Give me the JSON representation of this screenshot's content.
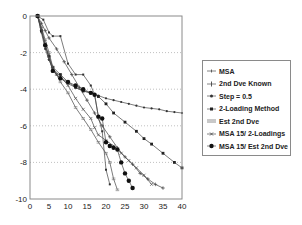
{
  "chart_data": {
    "type": "line",
    "title": "",
    "xlabel": "",
    "ylabel": "",
    "xlim": [
      0,
      40
    ],
    "ylim": [
      -10,
      0
    ],
    "x_ticks": [
      0,
      5,
      10,
      15,
      20,
      25,
      30,
      35,
      40
    ],
    "y_ticks": [
      0,
      -2,
      -4,
      -6,
      -8,
      -10
    ],
    "grid": {
      "horizontal_dotted": true,
      "vertical": false
    },
    "legend_position": "right",
    "series": [
      {
        "name": "MSA",
        "marker": "plus-small",
        "x": [
          2,
          3.5,
          5,
          6,
          8,
          10,
          12,
          14,
          16,
          17,
          18,
          19,
          20,
          21
        ],
        "y": [
          0,
          -0.2,
          -0.9,
          -1.1,
          -1.1,
          -2.6,
          -3.2,
          -3.2,
          -3.8,
          -4.3,
          -5.5,
          -6.3,
          -8.4,
          -9.2
        ]
      },
      {
        "name": "2nd Dve Known",
        "marker": "plus",
        "x": [
          2,
          3,
          4,
          5,
          7,
          9,
          11,
          13,
          15,
          17,
          19,
          21,
          23,
          25,
          27,
          29,
          31,
          33,
          35
        ],
        "y": [
          0,
          -0.4,
          -0.8,
          -1.2,
          -1.8,
          -2.5,
          -3.2,
          -3.9,
          -4.6,
          -5.3,
          -6.0,
          -6.6,
          -7.2,
          -7.7,
          -8.1,
          -8.6,
          -8.9,
          -9.2,
          -9.4
        ]
      },
      {
        "name": "Step = 0.5",
        "marker": "dot-small",
        "x": [
          2,
          3,
          4,
          5,
          6,
          7,
          8,
          10,
          12,
          14,
          16,
          18,
          20,
          22,
          24,
          26,
          28,
          30,
          32,
          34,
          36,
          38,
          40
        ],
        "y": [
          0,
          -0.9,
          -1.8,
          -2.4,
          -2.9,
          -3.2,
          -3.4,
          -3.7,
          -3.9,
          -4.1,
          -4.2,
          -4.35,
          -4.5,
          -4.6,
          -4.7,
          -4.8,
          -4.9,
          -5.0,
          -5.05,
          -5.1,
          -5.2,
          -5.25,
          -5.3
        ]
      },
      {
        "name": "2-Loading Method",
        "marker": "square",
        "x": [
          2,
          3,
          4,
          5,
          6,
          8,
          10,
          12,
          14,
          16,
          18,
          20,
          22,
          25,
          28,
          30,
          32,
          35,
          38,
          40
        ],
        "y": [
          0,
          -0.8,
          -1.6,
          -2.2,
          -2.8,
          -3.2,
          -3.6,
          -3.9,
          -4.1,
          -4.2,
          -4.4,
          -4.8,
          -5.3,
          -5.8,
          -6.3,
          -6.7,
          -7.0,
          -7.5,
          -8.0,
          -8.3
        ]
      },
      {
        "name": "Est 2nd Dve",
        "marker": "dash",
        "x": [
          2,
          3,
          4,
          5,
          6,
          7,
          8,
          10,
          12,
          14,
          16,
          18,
          20,
          21,
          22,
          23
        ],
        "y": [
          0,
          -0.6,
          -1.3,
          -2.0,
          -2.8,
          -3.2,
          -3.6,
          -4.2,
          -5.0,
          -5.6,
          -6.2,
          -6.9,
          -7.5,
          -8.0,
          -8.9,
          -9.5
        ]
      },
      {
        "name": "MSA 15/ 2-Loadings",
        "marker": "asterisk",
        "x": [
          2,
          3,
          4,
          5,
          6,
          8,
          10,
          12,
          14,
          16,
          17,
          18,
          20,
          22,
          24,
          26,
          28,
          30,
          32
        ],
        "y": [
          0,
          -0.7,
          -1.5,
          -2.3,
          -2.9,
          -3.3,
          -3.8,
          -4.5,
          -5.1,
          -5.6,
          -6.1,
          -6.5,
          -6.8,
          -7.1,
          -7.5,
          -7.9,
          -8.3,
          -8.7,
          -9.2
        ]
      },
      {
        "name": "MSA 15/ Est 2nd Dve",
        "marker": "dot-large",
        "x": [
          2,
          4,
          6,
          8,
          10,
          12,
          14,
          16,
          17,
          18,
          19,
          20,
          21,
          22,
          23,
          24,
          25,
          26,
          27
        ],
        "y": [
          0,
          -1.6,
          -3.0,
          -3.4,
          -3.6,
          -3.8,
          -4.0,
          -4.2,
          -4.3,
          -5.5,
          -5.6,
          -6.9,
          -7.1,
          -7.2,
          -7.3,
          -8.0,
          -8.6,
          -9.0,
          -9.4
        ]
      }
    ]
  },
  "legend": {
    "items": [
      {
        "label": "MSA"
      },
      {
        "label": "2nd Dve Known"
      },
      {
        "label": "Step = 0.5"
      },
      {
        "label": "2-Loading Method"
      },
      {
        "label": "Est 2nd Dve"
      },
      {
        "label": "MSA 15/ 2-Loadings"
      },
      {
        "label": "MSA 15/ Est 2nd Dve"
      }
    ]
  },
  "colors": {
    "axis": "#8a8a8a",
    "grid": "#b0b0b0",
    "line": "#444444",
    "marker": "#222222",
    "text": "#222222"
  }
}
